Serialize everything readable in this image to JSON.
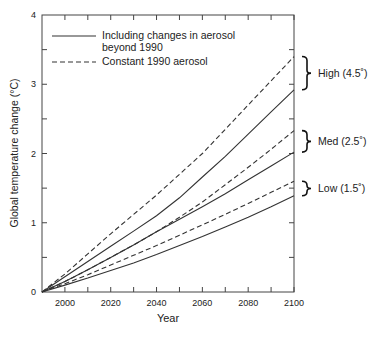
{
  "chart_data": {
    "type": "line",
    "title": "",
    "xlabel": "Year",
    "ylabel": "Global temperature change (°C)",
    "xlim": [
      1990,
      2100
    ],
    "ylim": [
      0,
      4
    ],
    "x_ticks": [
      2000,
      2020,
      2040,
      2060,
      2080,
      2100
    ],
    "y_ticks": [
      0,
      1,
      2,
      3,
      4
    ],
    "grid": false,
    "legend": {
      "position": "upper left",
      "entries": [
        {
          "label": "Including changes in aerosol beyond 1990",
          "line1": "Including changes in aerosol",
          "line2": "beyond 1990",
          "style": "solid"
        },
        {
          "label": "Constant 1990 aerosol",
          "style": "dashed"
        }
      ]
    },
    "x": [
      1990,
      2000,
      2010,
      2020,
      2030,
      2040,
      2050,
      2060,
      2070,
      2080,
      2090,
      2100
    ],
    "series": [
      {
        "name": "High (4.5°) - Constant 1990 aerosol",
        "style": "dashed",
        "values": [
          0,
          0.26,
          0.55,
          0.84,
          1.12,
          1.4,
          1.7,
          2.0,
          2.35,
          2.7,
          3.05,
          3.4
        ]
      },
      {
        "name": "High (4.5°) - Including changes in aerosol",
        "style": "solid",
        "values": [
          0,
          0.22,
          0.44,
          0.66,
          0.88,
          1.1,
          1.36,
          1.66,
          1.96,
          2.28,
          2.6,
          2.92
        ]
      },
      {
        "name": "Med (2.5°) - Constant 1990 aerosol",
        "style": "dashed",
        "values": [
          0,
          0.15,
          0.32,
          0.5,
          0.68,
          0.87,
          1.08,
          1.3,
          1.55,
          1.8,
          2.06,
          2.33
        ]
      },
      {
        "name": "Med (2.5°) - Including changes in aerosol",
        "style": "solid",
        "values": [
          0,
          0.15,
          0.32,
          0.5,
          0.68,
          0.87,
          1.05,
          1.23,
          1.42,
          1.62,
          1.82,
          2.02
        ]
      },
      {
        "name": "Low (1.5°) - Constant 1990 aerosol",
        "style": "dashed",
        "values": [
          0,
          0.12,
          0.25,
          0.39,
          0.53,
          0.67,
          0.82,
          0.97,
          1.12,
          1.28,
          1.44,
          1.6
        ]
      },
      {
        "name": "Low (1.5°) - Including changes in aerosol",
        "style": "solid",
        "values": [
          0,
          0.1,
          0.2,
          0.31,
          0.42,
          0.54,
          0.67,
          0.8,
          0.94,
          1.08,
          1.23,
          1.39
        ]
      }
    ],
    "annotations": [
      {
        "text": "High (4.5˚)",
        "y_range": [
          2.92,
          3.4
        ]
      },
      {
        "text": "Med (2.5˚)",
        "y_range": [
          2.02,
          2.33
        ]
      },
      {
        "text": "Low (1.5˚)",
        "y_range": [
          1.39,
          1.6
        ]
      }
    ]
  }
}
